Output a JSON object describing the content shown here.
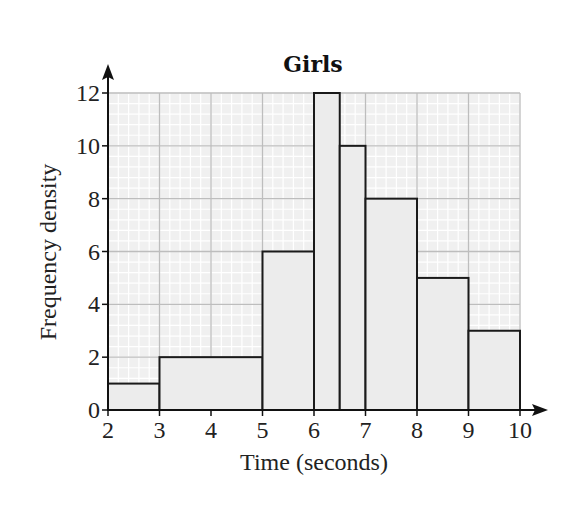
{
  "chart_data": {
    "type": "bar",
    "subtype": "histogram",
    "title": "Girls",
    "xlabel": "Time (seconds)",
    "ylabel": "Frequency density",
    "xlim": [
      2,
      10
    ],
    "ylim": [
      0,
      12
    ],
    "x_ticks": [
      2,
      3,
      4,
      5,
      6,
      7,
      8,
      9,
      10
    ],
    "y_ticks": [
      0,
      2,
      4,
      6,
      8,
      10,
      12
    ],
    "grid": true,
    "legend": null,
    "bins": [
      {
        "from": 2,
        "to": 3,
        "value": 1
      },
      {
        "from": 3,
        "to": 5,
        "value": 2
      },
      {
        "from": 5,
        "to": 6,
        "value": 6
      },
      {
        "from": 6,
        "to": 6.5,
        "value": 12
      },
      {
        "from": 6.5,
        "to": 7,
        "value": 10
      },
      {
        "from": 7,
        "to": 8,
        "value": 8
      },
      {
        "from": 8,
        "to": 9,
        "value": 5
      },
      {
        "from": 9,
        "to": 10,
        "value": 3
      }
    ],
    "categories": [
      "2-3",
      "3-5",
      "5-6",
      "6-6.5",
      "6.5-7",
      "7-8",
      "8-9",
      "9-10"
    ],
    "values": [
      1,
      2,
      6,
      12,
      10,
      8,
      5,
      3
    ]
  },
  "colors": {
    "bar_fill": "#ececec",
    "bar_stroke": "#1a1a1a",
    "grid_major": "#bdbdbd",
    "grid_minor": "#ffffff",
    "grid_bg": "#f0f0f0",
    "axis": "#111111"
  }
}
